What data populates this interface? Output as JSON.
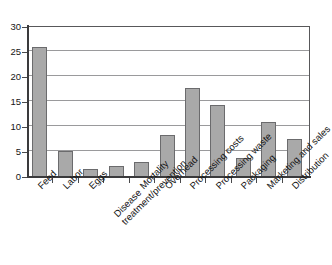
{
  "chart_data": {
    "type": "bar",
    "title": "",
    "subtitle": "",
    "xlabel": "",
    "ylabel": "",
    "ylim": [
      0,
      30
    ],
    "yticks": [
      0,
      5,
      10,
      15,
      20,
      25,
      30
    ],
    "ytick_labels": [
      "0",
      "5",
      "10",
      "15",
      "20",
      "25",
      "30"
    ],
    "grid": "horizontal",
    "legend": "none",
    "bar_color": "#a9a9a9",
    "bar_edge_color": "#6b6b6d",
    "axis_color": "#3a3a3c",
    "gridline_color": "#9a9a9c",
    "background": "#ffffff",
    "xtick_label_rotation": -45,
    "categories": [
      "Feed",
      "Labor",
      "Eggs",
      "Disease treatment/prevention",
      "Mortality",
      "Overhead",
      "Processing costs",
      "Processing waste",
      "Packaging",
      "Marketing and sales",
      "Distribution"
    ],
    "values": [
      26.0,
      5.2,
      1.6,
      2.2,
      3.0,
      8.5,
      17.9,
      14.4,
      3.8,
      11.1,
      7.7
    ]
  },
  "xlabel_lines": [
    [
      "Feed"
    ],
    [
      "Labor"
    ],
    [
      "Eggs"
    ],
    [
      "Disease",
      "treatment/prevention"
    ],
    [
      "Mortality"
    ],
    [
      "Overhead"
    ],
    [
      "Processing costs"
    ],
    [
      "Processing waste"
    ],
    [
      "Packaging"
    ],
    [
      "Marketing and sales"
    ],
    [
      "Distribution"
    ]
  ]
}
